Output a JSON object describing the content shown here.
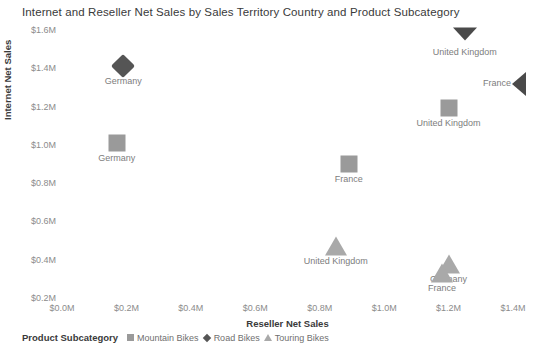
{
  "chart_data": {
    "type": "scatter",
    "title": "Internet and Reseller Net Sales by Sales Territory Country and Product Subcategory",
    "xlabel": "Reseller Net Sales",
    "ylabel": "Internet Net Sales",
    "xlim": [
      0.0,
      1.4
    ],
    "ylim": [
      0.2,
      1.6
    ],
    "grid": false,
    "legend_position": "bottom-left",
    "legend_title": "Product Subcategory",
    "x_ticks": [
      "$0.0M",
      "$0.2M",
      "$0.4M",
      "$0.6M",
      "$0.8M",
      "$1.0M",
      "$1.2M",
      "$1.4M"
    ],
    "x_tick_values": [
      0.0,
      0.2,
      0.4,
      0.6,
      0.8,
      1.0,
      1.2,
      1.4
    ],
    "y_ticks": [
      "$0.2M",
      "$0.4M",
      "$0.6M",
      "$0.8M",
      "$1.0M",
      "$1.2M",
      "$1.4M",
      "$1.6M"
    ],
    "y_tick_values": [
      0.2,
      0.4,
      0.6,
      0.8,
      1.0,
      1.2,
      1.4,
      1.6
    ],
    "y_origin_tick": "$0.0M",
    "series": [
      {
        "name": "Mountain Bikes",
        "marker": "square",
        "color": "#9a9a9a",
        "points": [
          {
            "label": "Germany",
            "x": 0.17,
            "y": 1.01,
            "clipped": false
          },
          {
            "label": "France",
            "x": 0.89,
            "y": 0.9,
            "clipped": false
          },
          {
            "label": "United Kingdom",
            "x": 1.2,
            "y": 1.19,
            "clipped": false
          }
        ]
      },
      {
        "name": "Road Bikes",
        "marker": "diamond",
        "color": "#555555",
        "points": [
          {
            "label": "Germany",
            "x": 0.19,
            "y": 1.41,
            "clipped": false
          },
          {
            "label": "United Kingdom",
            "x": 1.25,
            "y": 1.68,
            "clipped": true,
            "clip_edge": "top"
          },
          {
            "label": "France",
            "x": 1.45,
            "y": 1.32,
            "clipped": true,
            "clip_edge": "right"
          }
        ]
      },
      {
        "name": "Touring Bikes",
        "marker": "triangle",
        "color": "#a9a9a9",
        "points": [
          {
            "label": "United Kingdom",
            "x": 0.85,
            "y": 0.47,
            "clipped": false
          },
          {
            "label": "Germany",
            "x": 1.2,
            "y": 0.38,
            "clipped": false
          },
          {
            "label": "France",
            "x": 1.18,
            "y": 0.33,
            "clipped": false
          }
        ]
      }
    ]
  }
}
